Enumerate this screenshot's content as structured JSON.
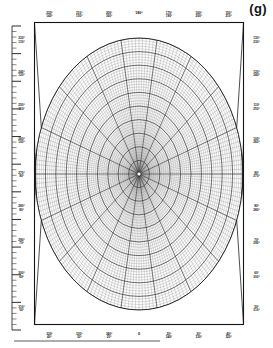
{
  "figure": {
    "panel_label": "(g)",
    "center_top_label": "180°",
    "center_bottom_label": "0"
  },
  "chart_data": {
    "type": "line",
    "title": "(g)",
    "subtype": "polar-grid",
    "xlabel": "",
    "ylabel": "",
    "grid": true,
    "legend": "none",
    "angular_axis": {
      "unit": "degrees",
      "top_center": "180°",
      "bottom_center": "0",
      "range": [
        0,
        360
      ],
      "major_step": 20,
      "minor_step": 2
    },
    "radial_axis": {
      "rings_major": 10,
      "rings_minor": 50,
      "ticks_left_major": 11,
      "ticks_left_minor": 55
    },
    "labels_top": [
      {
        "top": "220°",
        "bottom": "140°"
      },
      {
        "top": "210°",
        "bottom": "150°"
      },
      {
        "top": "200°",
        "bottom": "160°"
      },
      {
        "top": "180°",
        "bottom": ""
      },
      {
        "top": "170°",
        "bottom": "190°"
      },
      {
        "top": "160°",
        "bottom": "200°"
      },
      {
        "top": "150°",
        "bottom": "210°"
      }
    ],
    "labels_bottom": [
      {
        "top": "320°",
        "bottom": "40°"
      },
      {
        "top": "330°",
        "bottom": "30°"
      },
      {
        "top": "340°",
        "bottom": "20°"
      },
      {
        "top": "0",
        "bottom": ""
      },
      {
        "top": "20°",
        "bottom": "340°"
      },
      {
        "top": "30°",
        "bottom": "330°"
      },
      {
        "top": "40°",
        "bottom": "320°"
      }
    ],
    "labels_left": [
      {
        "top": "230°",
        "bottom": "130°"
      },
      {
        "top": "240°",
        "bottom": "120°"
      },
      {
        "top": "250°",
        "bottom": "110°"
      },
      {
        "top": "260°",
        "bottom": "100°"
      },
      {
        "top": "270°",
        "bottom": "90°"
      },
      {
        "top": "280°",
        "bottom": "80°"
      },
      {
        "top": "290°",
        "bottom": "70°"
      },
      {
        "top": "300°",
        "bottom": "60°"
      },
      {
        "top": "310°",
        "bottom": "50°"
      }
    ],
    "labels_right": [
      {
        "top": "130°",
        "bottom": "230°"
      },
      {
        "top": "120°",
        "bottom": "240°"
      },
      {
        "top": "110°",
        "bottom": "250°"
      },
      {
        "top": "100°",
        "bottom": "260°"
      },
      {
        "top": "90°",
        "bottom": "270°"
      },
      {
        "top": "80°",
        "bottom": "280°"
      },
      {
        "top": "70°",
        "bottom": "290°"
      },
      {
        "top": "60°",
        "bottom": "300°"
      },
      {
        "top": "50°",
        "bottom": "310°"
      }
    ]
  },
  "colors": {
    "ink": "#141414",
    "grid_major": "#2a2a2a",
    "grid_minor": "#888888",
    "paper": "#ffffff"
  }
}
